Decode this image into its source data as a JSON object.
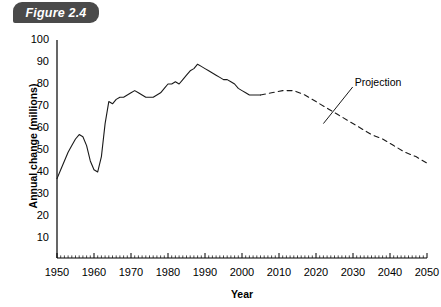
{
  "figure": {
    "tab_label": "Figure 2.4"
  },
  "chart_data": {
    "type": "line",
    "title": "Figure 2.4",
    "xlabel": "Year",
    "ylabel": "Annual change (millions)",
    "xlim": [
      1950,
      2050
    ],
    "ylim": [
      0,
      100
    ],
    "xticks": [
      1950,
      1960,
      1970,
      1980,
      1990,
      2000,
      2010,
      2020,
      2030,
      2040,
      2050
    ],
    "yticks": [
      10,
      20,
      30,
      40,
      50,
      60,
      70,
      80,
      90,
      100
    ],
    "grid": false,
    "legend": "none",
    "annotations": [
      {
        "text": "Projection",
        "x": 2031,
        "y": 80,
        "pointer_x": 2022,
        "pointer_y": 62
      }
    ],
    "series": [
      {
        "name": "Historical",
        "style": "solid",
        "x": [
          1950,
          1951,
          1952,
          1953,
          1954,
          1955,
          1956,
          1957,
          1958,
          1959,
          1960,
          1961,
          1962,
          1963,
          1964,
          1965,
          1966,
          1967,
          1968,
          1969,
          1970,
          1971,
          1972,
          1973,
          1974,
          1975,
          1976,
          1977,
          1978,
          1979,
          1980,
          1981,
          1982,
          1983,
          1984,
          1985,
          1986,
          1987,
          1988,
          1989,
          1990,
          1991,
          1992,
          1993,
          1994,
          1995,
          1996,
          1997,
          1998,
          1999,
          2000,
          2001,
          2002,
          2003,
          2004,
          2005
        ],
        "y": [
          37,
          41,
          45,
          49,
          52,
          55,
          57,
          56,
          52,
          45,
          41,
          40,
          47,
          62,
          72,
          71,
          73,
          74,
          74,
          75,
          76,
          77,
          76,
          75,
          74,
          74,
          74,
          75,
          76,
          78,
          80,
          80,
          81,
          80,
          82,
          84,
          86,
          87,
          89,
          88,
          87,
          86,
          85,
          84,
          83,
          82,
          82,
          81,
          80,
          78,
          77,
          76,
          75,
          75,
          75,
          75
        ]
      },
      {
        "name": "Projection",
        "style": "dashed",
        "x": [
          2005,
          2008,
          2011,
          2014,
          2017,
          2020,
          2023,
          2026,
          2029,
          2032,
          2035,
          2038,
          2041,
          2044,
          2047,
          2050
        ],
        "y": [
          75,
          76,
          77,
          77,
          75,
          72,
          69,
          66,
          63,
          60,
          57,
          55,
          52,
          49,
          47,
          44
        ]
      }
    ]
  },
  "axis_geometry": {
    "plot_left": 57,
    "plot_right": 427,
    "plot_top": 40,
    "plot_bottom": 258,
    "y_value_top": 100,
    "y_value_bottom": 0.9
  }
}
